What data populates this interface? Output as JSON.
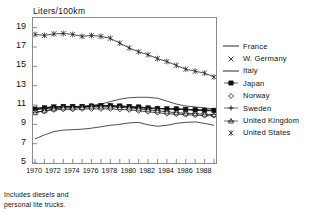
{
  "chart_data": {
    "type": "line",
    "title": "Liters/100km",
    "xlabel": "",
    "ylabel": "Liters/100km",
    "xlim": [
      1970,
      1989
    ],
    "ylim": [
      5,
      20
    ],
    "yticks": [
      5,
      7,
      9,
      11,
      13,
      15,
      17,
      19
    ],
    "ytick_labels": [
      "5",
      "7",
      "9",
      "11",
      "13",
      "15",
      "17",
      "19"
    ],
    "xticks": [
      1970,
      1971,
      1972,
      1973,
      1974,
      1975,
      1976,
      1977,
      1978,
      1979,
      1980,
      1981,
      1982,
      1983,
      1984,
      1985,
      1986,
      1987,
      1988,
      1989
    ],
    "xtick_labels": [
      "1970",
      "1972",
      "1974",
      "1976",
      "1978",
      "1980",
      "1982",
      "1984",
      "1986",
      "1988"
    ],
    "xtick_label_years": [
      1970,
      1972,
      1974,
      1976,
      1978,
      1980,
      1982,
      1984,
      1986,
      1988
    ],
    "grid": false,
    "legend_position": "right",
    "annotation": "Includes diesels and personal lite trucks.",
    "x": [
      1970,
      1971,
      1972,
      1973,
      1974,
      1975,
      1976,
      1977,
      1978,
      1979,
      1980,
      1981,
      1982,
      1983,
      1984,
      1985,
      1986,
      1987,
      1988,
      1989
    ],
    "series": [
      {
        "name": "France",
        "marker": "none",
        "color": "#111111",
        "values": [
          7.5,
          7.9,
          8.25,
          8.4,
          8.45,
          8.5,
          8.6,
          8.75,
          8.9,
          9.0,
          9.15,
          9.2,
          8.95,
          8.8,
          8.9,
          9.1,
          9.2,
          9.25,
          9.1,
          8.9
        ]
      },
      {
        "name": "W. Germany",
        "marker": "x",
        "color": "#111111",
        "values": [
          10.7,
          10.75,
          10.8,
          10.85,
          10.8,
          10.8,
          10.85,
          10.9,
          10.9,
          10.85,
          10.8,
          10.7,
          10.65,
          10.6,
          10.6,
          10.55,
          10.5,
          10.45,
          10.4,
          10.4
        ]
      },
      {
        "name": "Italy",
        "marker": "none",
        "color": "#111111",
        "values": [
          10.5,
          10.6,
          10.7,
          10.8,
          10.8,
          10.85,
          10.95,
          11.1,
          11.35,
          11.6,
          11.75,
          11.8,
          11.8,
          11.7,
          11.4,
          11.1,
          10.9,
          10.8,
          10.7,
          10.6
        ]
      },
      {
        "name": "Japan",
        "marker": "dash-cross",
        "color": "#111111",
        "values": [
          10.55,
          10.7,
          10.8,
          10.85,
          10.85,
          10.85,
          10.9,
          10.95,
          10.95,
          10.9,
          10.85,
          10.8,
          10.7,
          10.65,
          10.6,
          10.6,
          10.55,
          10.5,
          10.45,
          10.45
        ]
      },
      {
        "name": "Norway",
        "marker": "diamond",
        "color": "#111111",
        "values": [
          10.3,
          10.35,
          10.5,
          10.55,
          10.55,
          10.6,
          10.6,
          10.6,
          10.6,
          10.55,
          10.5,
          10.4,
          10.3,
          10.2,
          10.1,
          10.05,
          10.0,
          9.95,
          9.9,
          9.9
        ]
      },
      {
        "name": "Sweden",
        "marker": "plus",
        "color": "#111111",
        "values": [
          10.6,
          10.7,
          10.8,
          10.85,
          10.85,
          10.85,
          10.9,
          10.9,
          10.9,
          10.85,
          10.8,
          10.75,
          10.7,
          10.65,
          10.6,
          10.6,
          10.55,
          10.5,
          10.5,
          10.45
        ]
      },
      {
        "name": "United Kingdom",
        "marker": "triangle",
        "color": "#111111",
        "values": [
          10.2,
          10.4,
          10.6,
          10.7,
          10.7,
          10.75,
          10.8,
          10.8,
          10.8,
          10.75,
          10.7,
          10.6,
          10.5,
          10.4,
          10.3,
          10.2,
          10.15,
          10.1,
          10.05,
          10.0
        ]
      },
      {
        "name": "United States",
        "marker": "star",
        "color": "#111111",
        "values": [
          18.3,
          18.2,
          18.35,
          18.4,
          18.3,
          18.1,
          18.2,
          18.1,
          17.9,
          17.4,
          16.9,
          16.5,
          16.2,
          15.8,
          15.5,
          15.1,
          14.7,
          14.5,
          14.3,
          13.9
        ]
      }
    ]
  },
  "footnote": {
    "line1": "Includes diesels and",
    "line2": "personal lite trucks."
  }
}
